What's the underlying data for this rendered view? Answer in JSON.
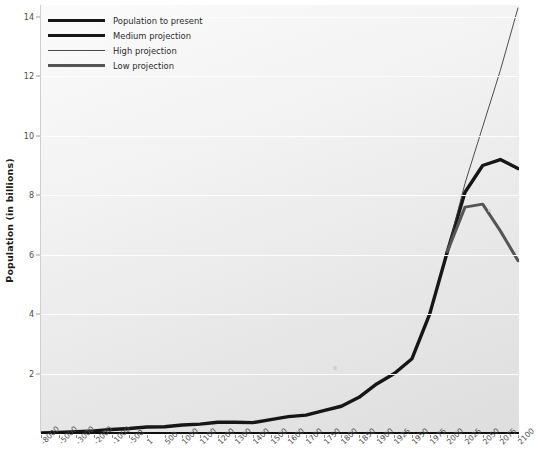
{
  "chart_data": {
    "type": "line",
    "title": "",
    "xlabel": "",
    "ylabel": "Population (in billions)",
    "ylim": [
      0,
      14.4
    ],
    "yticks": [
      2,
      4,
      6,
      8,
      10,
      12,
      14
    ],
    "grid": true,
    "legend_position": "top-left",
    "categories": [
      "-8000",
      "-5000",
      "-3000",
      "-2000",
      "-1000",
      "-500",
      "1",
      "500",
      "1000",
      "1100",
      "1200",
      "1300",
      "1400",
      "1500",
      "1600",
      "1700",
      "1750",
      "1800",
      "1850",
      "1900",
      "1925",
      "1950",
      "1975",
      "2000",
      "2025",
      "2050",
      "2075",
      "2100"
    ],
    "series": [
      {
        "name": "Population to present",
        "color": "#161616",
        "width": 3.4,
        "values": [
          0.005,
          0.02,
          0.04,
          0.07,
          0.12,
          0.15,
          0.2,
          0.21,
          0.27,
          0.3,
          0.36,
          0.36,
          0.35,
          0.45,
          0.55,
          0.6,
          0.75,
          0.9,
          1.2,
          1.65,
          2.0,
          2.5,
          4.0,
          6.1,
          null,
          null,
          null,
          null
        ]
      },
      {
        "name": "Medium projection",
        "color": "#161616",
        "width": 3.4,
        "values": [
          null,
          null,
          null,
          null,
          null,
          null,
          null,
          null,
          null,
          null,
          null,
          null,
          null,
          null,
          null,
          null,
          null,
          null,
          null,
          null,
          null,
          null,
          null,
          6.1,
          8.1,
          9.0,
          9.2,
          8.9
        ]
      },
      {
        "name": "High projection",
        "color": "#3a3a3a",
        "width": 0.9,
        "values": [
          null,
          null,
          null,
          null,
          null,
          null,
          null,
          null,
          null,
          null,
          null,
          null,
          null,
          null,
          null,
          null,
          null,
          null,
          null,
          null,
          null,
          null,
          null,
          6.1,
          8.4,
          10.3,
          12.2,
          14.3
        ]
      },
      {
        "name": "Low projection",
        "color": "#555555",
        "width": 3.0,
        "values": [
          null,
          null,
          null,
          null,
          null,
          null,
          null,
          null,
          null,
          null,
          null,
          null,
          null,
          null,
          null,
          null,
          null,
          null,
          null,
          null,
          null,
          null,
          null,
          6.1,
          7.6,
          7.7,
          6.8,
          5.8
        ]
      }
    ],
    "legend": [
      {
        "label": "Population to present",
        "style": "thick",
        "color": "#161616"
      },
      {
        "label": "Medium projection",
        "style": "thick",
        "color": "#161616"
      },
      {
        "label": "High projection",
        "style": "thin",
        "color": "#4a4a4a"
      },
      {
        "label": "Low projection",
        "style": "medium",
        "color": "#555555"
      }
    ]
  }
}
